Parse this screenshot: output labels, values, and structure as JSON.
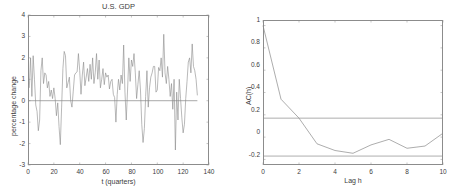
{
  "figure": {
    "background": "#ffffff",
    "line_color": "#8a8a8a",
    "axis_color": "#8c8c8c"
  },
  "chart_data": [
    {
      "type": "line",
      "panel": "left",
      "title": "U.S. GDP",
      "xlabel": "t (quarters)",
      "ylabel": "percentage change",
      "xlim": [
        0,
        140
      ],
      "ylim": [
        -3,
        4
      ],
      "xticks": [
        0,
        20,
        40,
        60,
        80,
        100,
        120,
        140
      ],
      "yticks": [
        -3,
        -2,
        -1,
        0,
        1,
        2,
        3,
        4
      ],
      "grid": false,
      "legend": "none",
      "annotations": [
        "horizontal reference line at y = 0"
      ],
      "x": [
        1,
        2,
        3,
        4,
        5,
        6,
        7,
        8,
        9,
        10,
        11,
        12,
        13,
        14,
        15,
        16,
        17,
        18,
        19,
        20,
        21,
        22,
        23,
        24,
        25,
        26,
        27,
        28,
        29,
        30,
        31,
        32,
        33,
        34,
        35,
        36,
        37,
        38,
        39,
        40,
        41,
        42,
        43,
        44,
        45,
        46,
        47,
        48,
        49,
        50,
        51,
        52,
        53,
        54,
        55,
        56,
        57,
        58,
        59,
        60,
        61,
        62,
        63,
        64,
        65,
        66,
        67,
        68,
        69,
        70,
        71,
        72,
        73,
        74,
        75,
        76,
        77,
        78,
        79,
        80,
        81,
        82,
        83,
        84,
        85,
        86,
        87,
        88,
        89,
        90,
        91,
        92,
        93,
        94,
        95,
        96,
        97,
        98,
        99,
        100,
        101,
        102,
        103,
        104,
        105,
        106,
        107,
        108,
        109,
        110,
        111,
        112,
        113,
        114,
        115,
        116,
        117,
        118,
        119,
        120,
        121,
        122,
        123,
        124,
        125,
        126,
        127,
        128,
        129,
        130,
        131
      ],
      "values": [
        0.6,
        2.0,
        0.2,
        2.1,
        1.0,
        -0.2,
        -0.5,
        -1.4,
        -0.9,
        1.4,
        2.0,
        0.8,
        1.3,
        1.2,
        0.6,
        0.9,
        0.2,
        0.5,
        0.1,
        0.6,
        0.1,
        -0.7,
        -0.1,
        -1.2,
        -2.05,
        -0.3,
        1.5,
        2.3,
        2.1,
        0.6,
        0.85,
        1.1,
        0.0,
        -0.3,
        0.45,
        1.2,
        1.3,
        1.35,
        2.2,
        1.4,
        0.3,
        1.2,
        1.8,
        0.7,
        1.1,
        1.5,
        0.9,
        1.7,
        1.0,
        2.0,
        0.8,
        1.3,
        2.2,
        1.0,
        1.9,
        0.6,
        1.0,
        1.5,
        0.75,
        1.3,
        1.1,
        1.2,
        0.55,
        0.9,
        1.0,
        0.3,
        0.15,
        -1.0,
        0.3,
        1.0,
        0.5,
        1.2,
        0.8,
        2.6,
        0.4,
        -0.9,
        0.5,
        2.0,
        0.9,
        1.9,
        1.6,
        2.2,
        1.3,
        0.1,
        0.75,
        1.4,
        0.5,
        -1.1,
        -1.95,
        -1.3,
        0.2,
        1.4,
        -0.3,
        0.6,
        1.1,
        1.3,
        1.6,
        1.6,
        0.4,
        0.5,
        1.55,
        1.4,
        2.0,
        1.1,
        3.1,
        1.3,
        0.8,
        1.6,
        1.0,
        0.2,
        0.8,
        -0.4,
        1.0,
        -2.3,
        0.4,
        -0.9,
        1.0,
        0.1,
        -0.8,
        -1.5,
        -1.1,
        0.1,
        0.9,
        1.8,
        2.0,
        1.3,
        2.65,
        1.6,
        1.4,
        1.0,
        0.25
      ]
    },
    {
      "type": "line",
      "panel": "right",
      "title": "",
      "xlabel": "Lag h",
      "ylabel": "AC(h)",
      "xlim": [
        0,
        10
      ],
      "ylim": [
        -0.25,
        1.05
      ],
      "xticks": [
        0,
        2,
        4,
        6,
        8,
        10
      ],
      "yticks": [
        -0.2,
        0,
        0.2,
        0.4,
        0.6,
        0.8,
        1
      ],
      "grid": false,
      "legend": "none",
      "annotations": [
        "confidence bounds at +0.17 and -0.17"
      ],
      "confidence_bounds": [
        0.17,
        -0.17
      ],
      "x": [
        0,
        1,
        2,
        3,
        4,
        5,
        6,
        7,
        8,
        9,
        10
      ],
      "values": [
        1.0,
        0.34,
        0.17,
        -0.06,
        -0.12,
        -0.145,
        -0.07,
        -0.02,
        -0.1,
        -0.08,
        0.035
      ]
    }
  ]
}
